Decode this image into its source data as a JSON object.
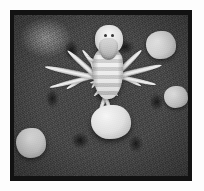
{
  "figure": {
    "caption": "",
    "frame_color": "#121212",
    "page_background": "#fdfdfd",
    "width_px": 204,
    "height_px": 191
  },
  "photo": {
    "type": "grayscale-photograph",
    "subject": "camel-spider",
    "subject_common_names": "camel spider, solifugid, wind scorpion",
    "background_description": "coarse gravel and pebbles",
    "tones": {
      "subject_highlight": "#f0ece2",
      "subject_midtone": "#ded9cc",
      "subject_shadow": "#b9b4a7",
      "gravel_light": "#a5a5a5",
      "gravel_mid": "#6a6a6a",
      "gravel_dark": "#2a2a2a",
      "pebble_white": "#f2f0ec"
    }
  },
  "elements": {
    "body_abdomen": "abdomen",
    "body_cephalothorax": "cephalothorax",
    "chelicerae": "chelicerae",
    "eye_left": "left eye",
    "eye_right": "right eye",
    "pebble_center": "bright white pebble (lower centre)",
    "pebble_upper_right": "pale pebble (upper right)",
    "pebble_lower_left": "pale pebble (lower left)",
    "pebble_mid_right": "pale pebble (mid right)"
  },
  "limbs": [
    {
      "name": "pedipalp-left",
      "left": "38%",
      "top": "22%",
      "len": 46,
      "thick": 5,
      "rot": -38
    },
    {
      "name": "pedipalp-right",
      "left": "58%",
      "top": "22%",
      "len": 46,
      "thick": 5,
      "rot": 34
    },
    {
      "name": "leg-left-1",
      "left": "40%",
      "top": "26%",
      "len": 62,
      "thick": 5,
      "rot": -62
    },
    {
      "name": "leg-left-2",
      "left": "41%",
      "top": "34%",
      "len": 70,
      "thick": 5,
      "rot": -78
    },
    {
      "name": "leg-left-3",
      "left": "42%",
      "top": "42%",
      "len": 74,
      "thick": 6,
      "rot": -104
    },
    {
      "name": "leg-left-4",
      "left": "44%",
      "top": "50%",
      "len": 66,
      "thick": 6,
      "rot": -134
    },
    {
      "name": "leg-right-1",
      "left": "58%",
      "top": "26%",
      "len": 60,
      "thick": 5,
      "rot": 58
    },
    {
      "name": "leg-right-2",
      "left": "59%",
      "top": "34%",
      "len": 72,
      "thick": 5,
      "rot": 76
    },
    {
      "name": "leg-right-3",
      "left": "60%",
      "top": "42%",
      "len": 78,
      "thick": 6,
      "rot": 102
    },
    {
      "name": "leg-right-4",
      "left": "58%",
      "top": "50%",
      "len": 68,
      "thick": 6,
      "rot": 132
    },
    {
      "name": "leg-rear-left",
      "left": "47%",
      "top": "62%",
      "len": 56,
      "thick": 5,
      "rot": -160
    },
    {
      "name": "leg-rear-right",
      "left": "55%",
      "top": "62%",
      "len": 58,
      "thick": 5,
      "rot": 158
    }
  ]
}
